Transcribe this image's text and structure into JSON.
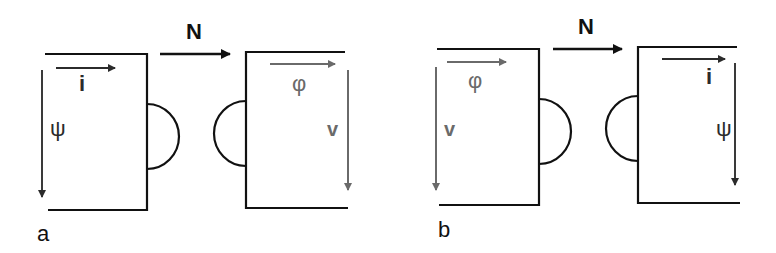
{
  "figure": {
    "colors": {
      "line": "#111111",
      "dark_arrow": "#2b2b2b",
      "gray_arrow": "#6a6a6a",
      "background": "#ffffff"
    },
    "panels": [
      {
        "id": "a",
        "label": "a",
        "flow_label": "N",
        "left_block": {
          "horizontal_arrow_label": "i",
          "vertical_arrow_label": "ψ",
          "arrow_tone": "dark"
        },
        "right_block": {
          "horizontal_arrow_label": "φ",
          "vertical_arrow_label": "v",
          "arrow_tone": "gray"
        }
      },
      {
        "id": "b",
        "label": "b",
        "flow_label": "N",
        "left_block": {
          "horizontal_arrow_label": "φ",
          "vertical_arrow_label": "v",
          "arrow_tone": "gray"
        },
        "right_block": {
          "horizontal_arrow_label": "i",
          "vertical_arrow_label": "ψ",
          "arrow_tone": "dark"
        }
      }
    ]
  }
}
